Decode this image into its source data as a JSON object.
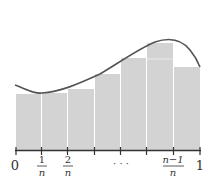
{
  "diagram": {
    "bar_color": "#d3d3d3",
    "curve_color": "#555555",
    "axis_color": "#333333",
    "tick_labels": {
      "zero": "0",
      "one_over_n_num": "1",
      "one_over_n_den": "n",
      "two_over_n_num": "2",
      "two_over_n_den": "n",
      "ellipsis": "· · ·",
      "nm1_over_n_num": "n−1",
      "nm1_over_n_den": "n",
      "one": "1"
    },
    "bars": [
      {
        "x": 16,
        "top": 94,
        "width": 25
      },
      {
        "x": 42,
        "top": 93,
        "width": 25
      },
      {
        "x": 68,
        "top": 89,
        "width": 26
      },
      {
        "x": 95,
        "top": 74,
        "width": 25
      },
      {
        "x": 121,
        "top": 58,
        "width": 25
      },
      {
        "x": 147,
        "top": 43,
        "width": 26
      },
      {
        "x": 174,
        "top": 67,
        "width": 26
      }
    ]
  }
}
